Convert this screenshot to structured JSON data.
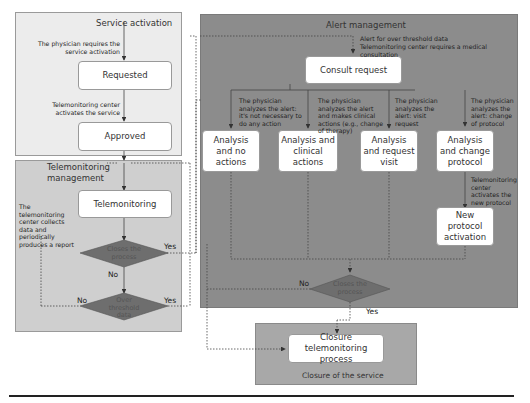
{
  "regions": {
    "service_activation": "Service activation",
    "telemonitoring_management": "Telemonitoring\nmanagement",
    "alert_management": "Alert management",
    "closure_of_service": "Closure of the service"
  },
  "nodes": {
    "requested": "Requested",
    "approved": "Approved",
    "telemonitoring": "Telemonitoring",
    "consult_request": "Consult request",
    "analysis_no_actions": "Analysis and no actions",
    "analysis_clinical_actions": "Analysis and clinical actions",
    "analysis_request_visit": "Analysis and request visit",
    "analysis_change_protocol": "Analysis and change protocol",
    "new_protocol_activation": "New protocol activation",
    "closure_process": "Closure telemonitoring process"
  },
  "decisions": {
    "close_process_1": "Closes the process",
    "over_threshold": "Over threshold data",
    "close_process_2": "Closes the process"
  },
  "notes": {
    "physician_requires": "The physician requires the service activation",
    "center_activates": "Telemonitoring center activates the service",
    "center_collects": "The telemonitoring center collects data and periodically produces a report",
    "alert_over_threshold": "Alert for over threshold data",
    "center_requires_consult": "Telemonitoring center requires a medical consultation",
    "no_action_note": "The physician analyzes the alert: it's not necessary to do any action",
    "clinical_note": "The physician analyzes the alert and makes clinical actions (e.g., change of therapy)",
    "visit_note": "The physician analyzes the alert: visit request",
    "change_note": "The physician analyzes the alert: change of protocol",
    "new_protocol_note": "Telemonitoring center activates the new protocol"
  },
  "branch_labels": {
    "yes": "Yes",
    "no": "No"
  },
  "colors": {
    "service_bg": "#ececec",
    "telemonitoring_bg": "#cfcfcf",
    "alert_bg": "#8c8c8c",
    "closure_bg": "#a8a8a8",
    "diamond": "#6e6e6e",
    "node_bg": "#ffffff"
  }
}
